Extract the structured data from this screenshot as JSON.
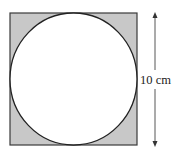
{
  "diagram": {
    "square": {
      "side_label": "10 cm",
      "fill": "#c8c8c8",
      "stroke": "#333333"
    },
    "circle": {
      "fill": "#ffffff",
      "stroke": "#222222"
    },
    "dimension": {
      "label": "10 cm",
      "orientation": "vertical",
      "arrow_color": "#444444"
    }
  }
}
